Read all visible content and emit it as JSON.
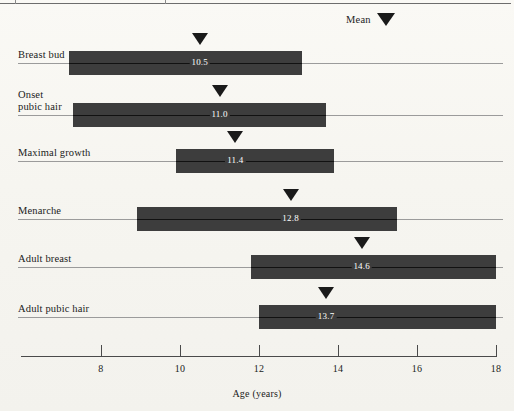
{
  "figure": {
    "background_color": "#f7f6f1",
    "bar_color": "#3d3d3d",
    "marker_color": "#1a1a1a",
    "rule_color": "#9b9b9b"
  },
  "legend": {
    "label": "Mean",
    "marker_icon": "down-triangle-icon"
  },
  "axis": {
    "title": "Age (years)",
    "ticks": [
      "8",
      "10",
      "12",
      "14",
      "16",
      "18"
    ],
    "tick_values": [
      8,
      10,
      12,
      14,
      16,
      18
    ],
    "range": [
      6.5,
      18.2
    ]
  },
  "chart_data": {
    "type": "bar",
    "title": "",
    "subtitle": "",
    "xlabel": "Age (years)",
    "ylabel": "",
    "xlim": [
      6.5,
      18.2
    ],
    "grid": false,
    "legend_position": "top-right",
    "legend_entries": [
      "Mean"
    ],
    "orientation": "horizontal-range",
    "categories": [
      "Breast bud",
      "Onset\npubic hair",
      "Maximal growth",
      "Menarche",
      "Adult breast",
      "Adult pubic hair"
    ],
    "series": [
      {
        "name": "Age range (years)",
        "ranges": [
          [
            7.2,
            13.1
          ],
          [
            7.3,
            13.7
          ],
          [
            9.9,
            13.9
          ],
          [
            8.9,
            15.5
          ],
          [
            11.8,
            18.0
          ],
          [
            12.0,
            18.0
          ]
        ]
      },
      {
        "name": "Mean (years)",
        "values": [
          10.5,
          11.0,
          11.4,
          12.8,
          14.6,
          13.7
        ]
      }
    ],
    "annotations": [
      "10.5",
      "11.0",
      "11.4",
      "12.8",
      "14.6",
      "13.7"
    ]
  },
  "rows": [
    {
      "label": "Breast bud",
      "label_lines": [
        "Breast bud"
      ],
      "mean": "10.5",
      "mean_value": 10.5,
      "range_start": 7.2,
      "range_end": 13.1
    },
    {
      "label": "Onset pubic hair",
      "label_lines": [
        "Onset",
        "pubic hair"
      ],
      "mean": "11.0",
      "mean_value": 11.0,
      "range_start": 7.3,
      "range_end": 13.7
    },
    {
      "label": "Maximal growth",
      "label_lines": [
        "Maximal growth"
      ],
      "mean": "11.4",
      "mean_value": 11.4,
      "range_start": 9.9,
      "range_end": 13.9
    },
    {
      "label": "Menarche",
      "label_lines": [
        "Menarche"
      ],
      "mean": "12.8",
      "mean_value": 12.8,
      "range_start": 8.9,
      "range_end": 15.5
    },
    {
      "label": "Adult breast",
      "label_lines": [
        "Adult breast"
      ],
      "mean": "14.6",
      "mean_value": 14.6,
      "range_start": 11.8,
      "range_end": 18.0
    },
    {
      "label": "Adult pubic hair",
      "label_lines": [
        "Adult pubic hair"
      ],
      "mean": "13.7",
      "mean_value": 13.7,
      "range_start": 12.0,
      "range_end": 18.0
    }
  ]
}
